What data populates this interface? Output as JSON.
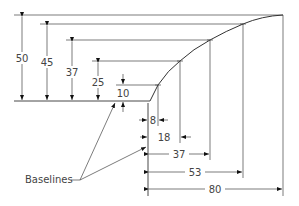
{
  "diagram": {
    "vertical_dims": [
      {
        "label": "50",
        "value": 50
      },
      {
        "label": "45",
        "value": 45
      },
      {
        "label": "37",
        "value": 37
      },
      {
        "label": "25",
        "value": 25
      },
      {
        "label": "10",
        "value": 10
      }
    ],
    "horizontal_dims": [
      {
        "label": "8",
        "value": 8
      },
      {
        "label": "18",
        "value": 18
      },
      {
        "label": "37",
        "value": 37
      },
      {
        "label": "53",
        "value": 53
      },
      {
        "label": "80",
        "value": 80
      }
    ],
    "callout": {
      "label": "Baselines"
    },
    "colors": {
      "line": "#333333",
      "text": "#444444",
      "background": "#ffffff"
    }
  }
}
